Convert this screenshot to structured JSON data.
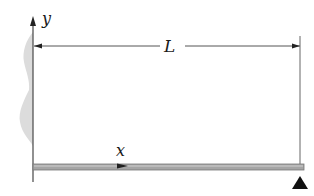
{
  "diagram": {
    "type": "beam-free-body",
    "labels": {
      "y_axis": "y",
      "x_axis": "x",
      "length": "L"
    },
    "elements": {
      "wall": "fixed wall (hatched, left)",
      "beam": "horizontal beam along x-axis",
      "support": "roller/pin support triangle at right end",
      "dimension": "length L from wall to support"
    },
    "colors": {
      "line": "#555555",
      "beam_fill": "#9a9a9a",
      "wall_shade": "#d8d8d8",
      "support": "#111111"
    }
  }
}
